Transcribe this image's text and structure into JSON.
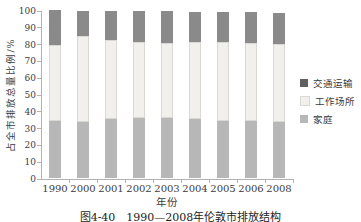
{
  "chart_data": {
    "type": "bar",
    "stacked": true,
    "title": "",
    "categories": [
      "1990",
      "2000",
      "2001",
      "2002",
      "2003",
      "2004",
      "2005",
      "2006",
      "2008"
    ],
    "series": [
      {
        "name": "家庭",
        "color": "#b7b7b7",
        "values": [
          34,
          33.5,
          35,
          35.5,
          35.5,
          35,
          34,
          34,
          33.5
        ]
      },
      {
        "name": "工作场所",
        "color": "#f1f0ec",
        "border": "#d9d8d2",
        "values": [
          45,
          51,
          47,
          45.5,
          45,
          46,
          47,
          46.5,
          46
        ]
      },
      {
        "name": "交通运输",
        "color": "#8a8a8a",
        "legend_color": "#606060",
        "values": [
          21,
          15,
          17.5,
          18.3,
          18.7,
          18,
          17.8,
          18.1,
          18.9
        ]
      }
    ],
    "xlabel": "年份",
    "ylabel": "占全市排放总量比例/%",
    "ylim": [
      0,
      100
    ],
    "y_ticks": [
      0,
      10,
      20,
      30,
      40,
      50,
      60,
      70,
      80,
      90,
      100
    ],
    "grid": false,
    "legend_position": "right",
    "legend_order_top_to_bottom": [
      "交通运输",
      "工作场所",
      "家庭"
    ],
    "axis_color": "#b2b2b2",
    "tick_label_color": "#3c3c3c"
  },
  "caption": "图4-40　1990—2008年伦敦市排放结构"
}
